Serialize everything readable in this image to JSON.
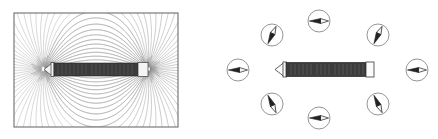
{
  "figure": {
    "title": "",
    "caption": "",
    "width": 438,
    "height": 139,
    "background": "#ffffff",
    "panel_count": 2
  },
  "colors": {
    "field_line": "#9a9a9a",
    "field_line_dark": "#7d7d7d",
    "magnet_body": "#3c3c3c",
    "magnet_body_edge": "#2a2a2a",
    "magnet_tip": "#f2f2f2",
    "magnet_outline": "#3a3a3a",
    "compass_ring": "#8a8a8a",
    "compass_face": "#ffffff",
    "needle_dark": "#232323",
    "needle_light": "#f5f5f5",
    "box_border": "#6e6e6e",
    "background": "#ffffff"
  },
  "left_panel": {
    "name": "iron-filings-photo",
    "description": "Iron filing field pattern around a bar magnet",
    "box": {
      "x": 14,
      "y": 13,
      "width": 164,
      "height": 114
    },
    "magnet": {
      "x": 44,
      "y": 63,
      "width": 104,
      "height": 13,
      "tip_left_label": "",
      "tip_right_label": ""
    },
    "pole_left": {
      "x": 44,
      "y": 69
    },
    "pole_right": {
      "x": 148,
      "y": 69
    },
    "field_line_count": 64
  },
  "right_panel": {
    "name": "compass-array-diagram",
    "description": "Solenoid surrounded by eight plotting compasses",
    "origin_x": 219,
    "magnet": {
      "x": 274,
      "y": 62,
      "width": 100,
      "height": 14,
      "tip_left_label": "",
      "cap_right_label": ""
    },
    "compass_radius": 11,
    "compasses": [
      {
        "id": "compass-top-left",
        "cx": 272,
        "cy": 35,
        "needle_deg": 205,
        "direction": "south-west"
      },
      {
        "id": "compass-top-center",
        "cx": 319,
        "cy": 21,
        "needle_deg": 270,
        "direction": "west"
      },
      {
        "id": "compass-top-right",
        "cx": 378,
        "cy": 35,
        "needle_deg": 205,
        "direction": "south-west"
      },
      {
        "id": "compass-middle-left",
        "cx": 238,
        "cy": 70,
        "needle_deg": 270,
        "direction": "west"
      },
      {
        "id": "compass-middle-right",
        "cx": 417,
        "cy": 70,
        "needle_deg": 270,
        "direction": "west"
      },
      {
        "id": "compass-bottom-left",
        "cx": 272,
        "cy": 104,
        "needle_deg": 335,
        "direction": "north-west"
      },
      {
        "id": "compass-bottom-center",
        "cx": 319,
        "cy": 118,
        "needle_deg": 270,
        "direction": "west"
      },
      {
        "id": "compass-bottom-right",
        "cx": 378,
        "cy": 104,
        "needle_deg": 335,
        "direction": "north-west"
      }
    ]
  }
}
